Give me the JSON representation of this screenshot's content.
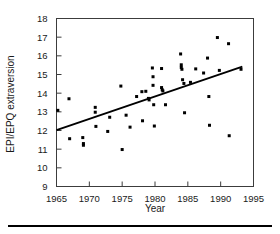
{
  "figure": {
    "caption_rule": true,
    "background": "#ffffff",
    "point_color": "#000000",
    "axis_color": "#3c3c3c",
    "line_color": "#000000"
  },
  "chart_data": {
    "type": "scatter",
    "title": "",
    "xlabel": "Year",
    "ylabel": "EPI/EPQ extraversion",
    "xlim": [
      1965,
      1995
    ],
    "ylim": [
      9,
      18
    ],
    "xticks": [
      1965,
      1970,
      1975,
      1980,
      1985,
      1990,
      1995
    ],
    "xtick_labels": [
      "1965",
      "1970",
      "1975",
      "1980",
      "1985",
      "1990",
      "1995"
    ],
    "yticks": [
      9,
      10,
      11,
      12,
      13,
      14,
      15,
      16,
      17,
      18
    ],
    "ytick_labels": [
      "9",
      "10",
      "11",
      "12",
      "13",
      "14",
      "15",
      "16",
      "17",
      "18"
    ],
    "grid": false,
    "legend": null,
    "marker": "square-dot",
    "marker_size": 3,
    "points": [
      {
        "x": 1965.2,
        "y": 13.08
      },
      {
        "x": 1966.9,
        "y": 13.7
      },
      {
        "x": 1967.0,
        "y": 11.56
      },
      {
        "x": 1969.0,
        "y": 11.62
      },
      {
        "x": 1969.1,
        "y": 11.3
      },
      {
        "x": 1969.1,
        "y": 11.21
      },
      {
        "x": 1970.9,
        "y": 13.24
      },
      {
        "x": 1970.9,
        "y": 12.98
      },
      {
        "x": 1971.0,
        "y": 12.22
      },
      {
        "x": 1972.8,
        "y": 11.95
      },
      {
        "x": 1973.1,
        "y": 12.71
      },
      {
        "x": 1974.8,
        "y": 14.38
      },
      {
        "x": 1975.0,
        "y": 10.98
      },
      {
        "x": 1975.6,
        "y": 12.82
      },
      {
        "x": 1976.2,
        "y": 12.18
      },
      {
        "x": 1977.2,
        "y": 13.82
      },
      {
        "x": 1978.0,
        "y": 14.08
      },
      {
        "x": 1978.1,
        "y": 12.52
      },
      {
        "x": 1978.6,
        "y": 14.1
      },
      {
        "x": 1979.0,
        "y": 13.72
      },
      {
        "x": 1979.1,
        "y": 13.64
      },
      {
        "x": 1979.6,
        "y": 15.35
      },
      {
        "x": 1979.7,
        "y": 14.88
      },
      {
        "x": 1979.7,
        "y": 14.42
      },
      {
        "x": 1979.8,
        "y": 13.38
      },
      {
        "x": 1979.9,
        "y": 12.24
      },
      {
        "x": 1981.0,
        "y": 15.32
      },
      {
        "x": 1981.0,
        "y": 14.3
      },
      {
        "x": 1981.1,
        "y": 14.18
      },
      {
        "x": 1981.2,
        "y": 14.12
      },
      {
        "x": 1981.6,
        "y": 13.38
      },
      {
        "x": 1983.9,
        "y": 16.1
      },
      {
        "x": 1984.0,
        "y": 15.52
      },
      {
        "x": 1984.0,
        "y": 15.38
      },
      {
        "x": 1984.1,
        "y": 15.28
      },
      {
        "x": 1984.2,
        "y": 14.72
      },
      {
        "x": 1984.4,
        "y": 14.52
      },
      {
        "x": 1984.5,
        "y": 12.95
      },
      {
        "x": 1985.4,
        "y": 14.58
      },
      {
        "x": 1986.2,
        "y": 15.3
      },
      {
        "x": 1987.4,
        "y": 15.08
      },
      {
        "x": 1988.0,
        "y": 15.88
      },
      {
        "x": 1988.2,
        "y": 13.82
      },
      {
        "x": 1988.3,
        "y": 12.28
      },
      {
        "x": 1989.5,
        "y": 16.98
      },
      {
        "x": 1989.8,
        "y": 15.22
      },
      {
        "x": 1991.2,
        "y": 16.65
      },
      {
        "x": 1991.3,
        "y": 11.72
      },
      {
        "x": 1993.1,
        "y": 15.28
      }
    ],
    "fit_line": {
      "label": "regression line",
      "x0": 1965.0,
      "y0": 12.02,
      "x1": 1993.3,
      "y1": 15.42
    }
  }
}
